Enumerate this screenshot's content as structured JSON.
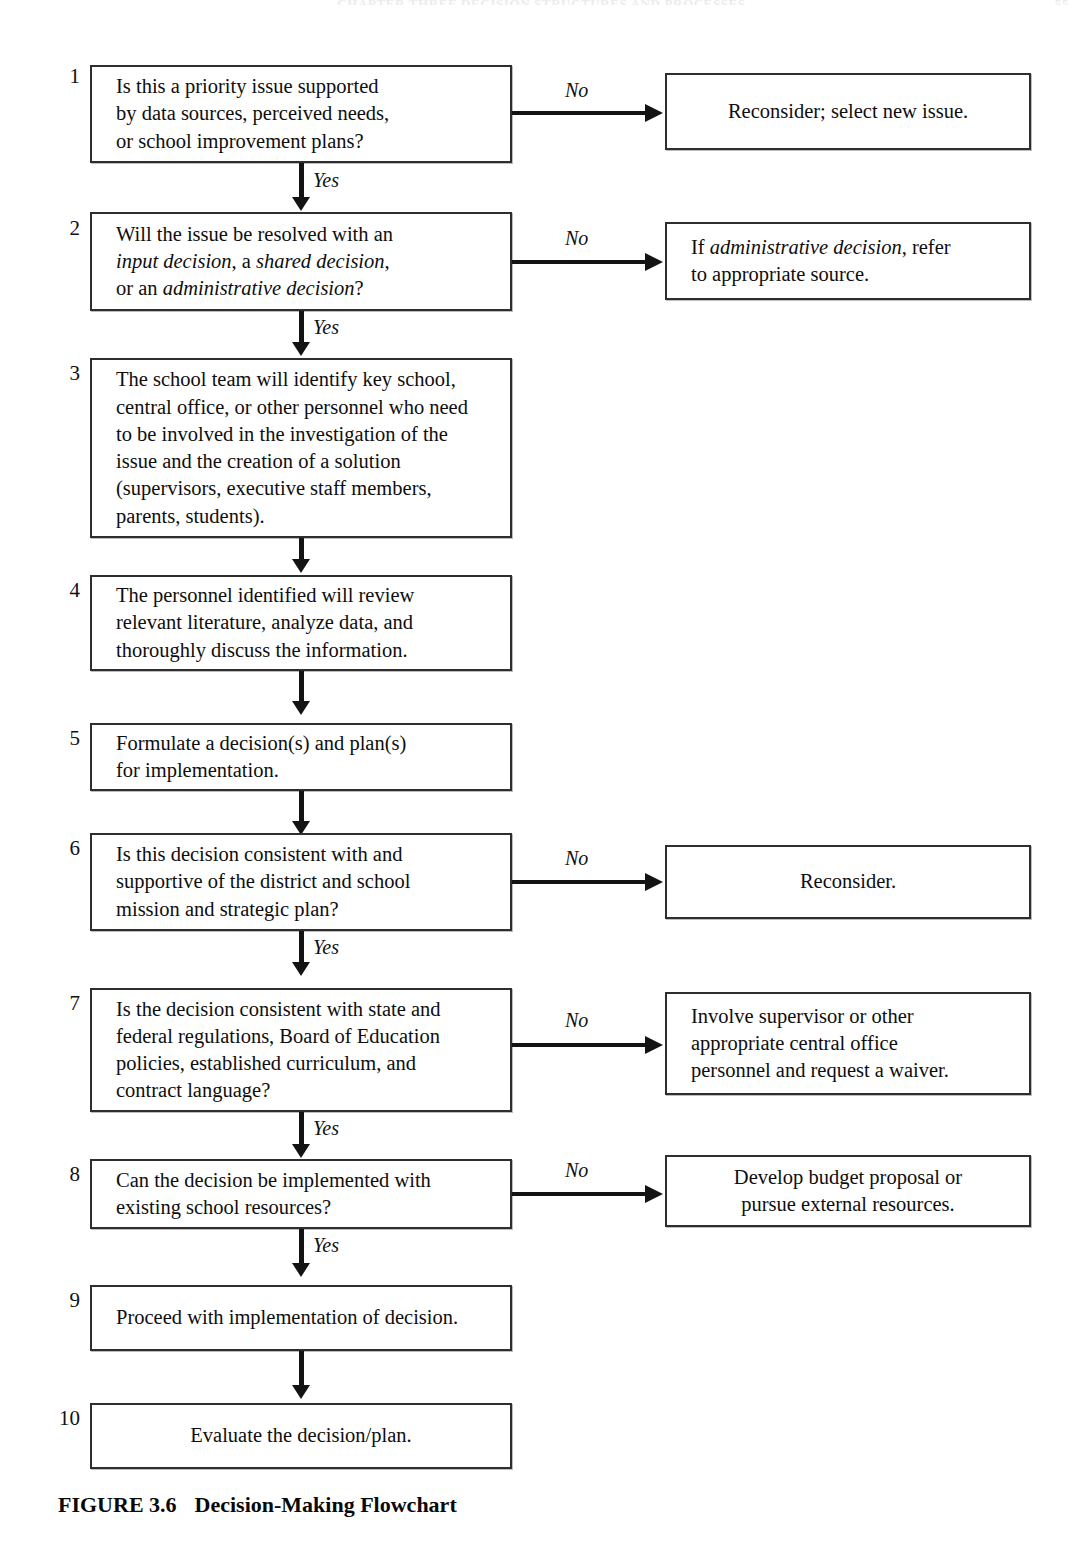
{
  "page": {
    "running_head": "CHAPTER THREE  DECISION STRUCTURES AND PROCESSES",
    "folio": "55"
  },
  "figure": {
    "label": "FIGURE 3.6",
    "title": "Decision-Making Flowchart"
  },
  "edge_labels": {
    "yes": "Yes",
    "no": "No"
  },
  "steps": [
    {
      "number": "1",
      "text": "Is this a priority issue supported by data sources, perceived needs, or school improvement plans?",
      "line1": "Is this a priority issue supported",
      "line2": "by data sources, perceived needs,",
      "line3": "or school improvement plans?"
    },
    {
      "number": "2",
      "text": "Will the issue be resolved with an input decision, a shared decision, or an administrative decision?",
      "line1_pre": "Will the issue be resolved with an",
      "line2_em1": "input decision",
      "line2_mid": ", a ",
      "line2_em2": "shared decision",
      "line2_post": ",",
      "line3_pre": "or an ",
      "line3_em": "administrative decision",
      "line3_post": "?"
    },
    {
      "number": "3",
      "text": "The school team will identify key school, central office, or other personnel who need to be involved in the investigation of the issue and the creation of a solution (supervisors, executive staff members, parents, students).",
      "line1": "The school team will identify key school,",
      "line2": "central office, or other personnel who need",
      "line3": "to be involved in the investigation of the",
      "line4": "issue and the creation of a solution",
      "line5": "(supervisors, executive staff members,",
      "line6": "parents, students)."
    },
    {
      "number": "4",
      "text": "The personnel identified will review relevant literature, analyze data, and thoroughly discuss the information.",
      "line1": "The personnel identified will review",
      "line2": "relevant literature, analyze data, and",
      "line3": "thoroughly discuss the information."
    },
    {
      "number": "5",
      "text": "Formulate a decision(s) and plan(s) for implementation.",
      "line1": "Formulate a decision(s) and plan(s)",
      "line2": "for implementation."
    },
    {
      "number": "6",
      "text": "Is this decision consistent with and supportive of the district and school mission and strategic plan?",
      "line1": "Is this decision consistent with and",
      "line2": "supportive of the district and school",
      "line3": "mission and strategic plan?"
    },
    {
      "number": "7",
      "text": "Is the decision consistent with state and federal regulations, Board of Education policies, established curriculum, and contract language?",
      "line1": "Is the decision consistent with state and",
      "line2": "federal regulations, Board of Education",
      "line3": "policies, established curriculum, and",
      "line4": "contract language?"
    },
    {
      "number": "8",
      "text": "Can the decision be implemented with existing school resources?",
      "line1": "Can the decision be implemented with",
      "line2": "existing school resources?"
    },
    {
      "number": "9",
      "text": "Proceed with implementation of decision.",
      "line1": "Proceed with implementation of decision."
    },
    {
      "number": "10",
      "text": "Evaluate the decision/plan.",
      "line1": "Evaluate the decision/plan."
    }
  ],
  "outcomes": [
    {
      "from_step": "1",
      "text": "Reconsider; select new issue.",
      "line1": "Reconsider; select new issue."
    },
    {
      "from_step": "2",
      "text": "If administrative decision, refer to appropriate source.",
      "line1_pre": "If ",
      "line1_em": "administrative decision",
      "line1_post": ", refer",
      "line2": "to appropriate source."
    },
    {
      "from_step": "6",
      "text": "Reconsider.",
      "line1": "Reconsider."
    },
    {
      "from_step": "7",
      "text": "Involve supervisor or other appropriate central office personnel and request a waiver.",
      "line1": "Involve supervisor or other",
      "line2": "appropriate central office",
      "line3": "personnel and request a waiver."
    },
    {
      "from_step": "8",
      "text": "Develop budget proposal or pursue external resources.",
      "line1": "Develop budget proposal or",
      "line2": "pursue external resources."
    }
  ]
}
